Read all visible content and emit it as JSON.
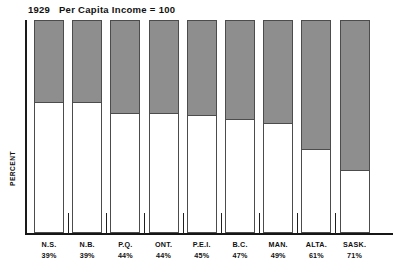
{
  "chart_data": {
    "type": "bar",
    "title_year": "1929",
    "title_rest": "Per Capita Income = 100",
    "xlabel": "",
    "ylabel": "PERCENT",
    "ylim": [
      0,
      100
    ],
    "grid": false,
    "legend": "none",
    "stacked": true,
    "categories": [
      "N.S.",
      "N.B.",
      "P.Q.",
      "ONT.",
      "P.E.I.",
      "B.C.",
      "MAN.",
      "ALTA.",
      "SASK."
    ],
    "value_labels": [
      "39%",
      "39%",
      "44%",
      "44%",
      "45%",
      "47%",
      "49%",
      "61%",
      "71%"
    ],
    "values": [
      39,
      39,
      44,
      44,
      45,
      47,
      49,
      61,
      71
    ],
    "series": [
      {
        "name": "Decline from 1929",
        "color": "#8e8e8e",
        "values": [
          39,
          39,
          44,
          44,
          45,
          47,
          49,
          61,
          71
        ]
      },
      {
        "name": "Remaining income",
        "color": "#ffffff",
        "values": [
          61,
          61,
          56,
          56,
          55,
          53,
          51,
          39,
          29
        ]
      }
    ]
  },
  "colors": {
    "bar_fill_top": "#8e8e8e",
    "bar_fill_bottom": "#ffffff",
    "bar_outline": "#4c4c4c",
    "axis": "#161616",
    "background": "#ffffff",
    "text": "#111111"
  }
}
